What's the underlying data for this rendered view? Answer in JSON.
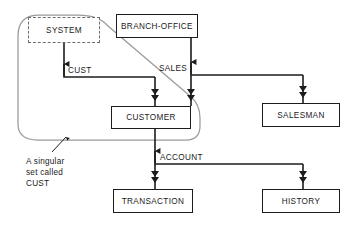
{
  "diagram": {
    "type": "bachman-data-structure-diagram",
    "title": "",
    "entities": [
      {
        "id": "system",
        "label": "SYSTEM",
        "x": 28,
        "y": 17,
        "w": 72,
        "h": 26,
        "border": "dashed"
      },
      {
        "id": "branch-office",
        "label": "BRANCH-OFFICE",
        "x": 116,
        "y": 14,
        "w": 82,
        "h": 24,
        "border": "solid"
      },
      {
        "id": "customer",
        "label": "CUSTOMER",
        "x": 111,
        "y": 106,
        "w": 80,
        "h": 23,
        "border": "solid"
      },
      {
        "id": "salesman",
        "label": "SALESMAN",
        "x": 262,
        "y": 103,
        "w": 78,
        "h": 24,
        "border": "solid"
      },
      {
        "id": "transaction",
        "label": "TRANSACTION",
        "x": 113,
        "y": 189,
        "w": 80,
        "h": 24,
        "border": "solid"
      },
      {
        "id": "history",
        "label": "HISTORY",
        "x": 262,
        "y": 189,
        "w": 78,
        "h": 24,
        "border": "solid"
      }
    ],
    "set_labels": [
      {
        "id": "cust",
        "text": "CUST",
        "x": 68,
        "y": 66
      },
      {
        "id": "sales",
        "text": "SALES",
        "x": 159,
        "y": 64
      },
      {
        "id": "account",
        "text": "ACCOUNT",
        "x": 160,
        "y": 153
      }
    ],
    "relationships": [
      {
        "owner": "system",
        "member": "customer",
        "set": "CUST"
      },
      {
        "owner": "branch-office",
        "member": "customer",
        "set": "SALES"
      },
      {
        "owner": "branch-office",
        "member": "salesman",
        "set": "SALES"
      },
      {
        "owner": "customer",
        "member": "transaction",
        "set": "ACCOUNT"
      },
      {
        "owner": "customer",
        "member": "history",
        "set": "ACCOUNT"
      }
    ],
    "annotation": {
      "id": "singular-set-note",
      "text": "A singular\nset called\nCUST",
      "x": 26,
      "y": 156
    },
    "colors": {
      "line": "#1c1c1c",
      "enclosure": "#9a9a9a",
      "dashed_border": "#6d6d6d",
      "text": "#1a1a1a",
      "background": "#ffffff"
    }
  }
}
